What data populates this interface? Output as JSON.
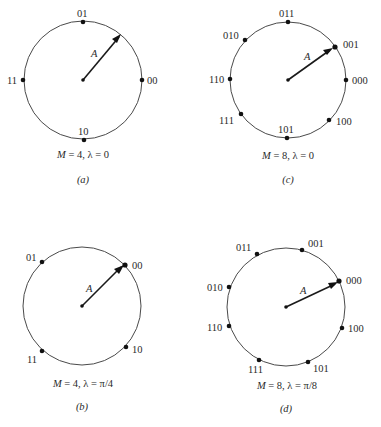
{
  "figure": {
    "panels": [
      {
        "id": "a",
        "tag": "(a)",
        "caption": "M = 4, λ = 0",
        "caption_parts": {
          "M": "M",
          "rest": " = 4, λ = 0"
        },
        "M": 4,
        "lambda": "0",
        "vector_label": "A",
        "points": [
          {
            "label": "00",
            "angle_deg": 0
          },
          {
            "label": "01",
            "angle_deg": 90
          },
          {
            "label": "11",
            "angle_deg": 180
          },
          {
            "label": "10",
            "angle_deg": 270
          }
        ]
      },
      {
        "id": "b",
        "tag": "(b)",
        "caption": "M = 4, λ = π/4",
        "caption_parts": {
          "M": "M",
          "rest": " = 4, λ = π/4"
        },
        "M": 4,
        "lambda": "π/4",
        "vector_label": "A",
        "points": [
          {
            "label": "00",
            "angle_deg": 45
          },
          {
            "label": "01",
            "angle_deg": 135
          },
          {
            "label": "11",
            "angle_deg": 225
          },
          {
            "label": "10",
            "angle_deg": 315
          }
        ]
      },
      {
        "id": "c",
        "tag": "(c)",
        "caption": "M = 8, λ = 0",
        "caption_parts": {
          "M": "M",
          "rest": " = 8, λ = 0"
        },
        "M": 8,
        "lambda": "0",
        "vector_label": "A",
        "points": [
          {
            "label": "000",
            "angle_deg": 0
          },
          {
            "label": "001",
            "angle_deg": 45
          },
          {
            "label": "011",
            "angle_deg": 90
          },
          {
            "label": "010",
            "angle_deg": 135
          },
          {
            "label": "110",
            "angle_deg": 180
          },
          {
            "label": "111",
            "angle_deg": 225
          },
          {
            "label": "101",
            "angle_deg": 270
          },
          {
            "label": "100",
            "angle_deg": 315
          }
        ]
      },
      {
        "id": "d",
        "tag": "(d)",
        "caption": "M = 8, λ = π/8",
        "caption_parts": {
          "M": "M",
          "rest": " = 8, λ = π/8"
        },
        "M": 8,
        "lambda": "π/8",
        "vector_label": "A",
        "points": [
          {
            "label": "000",
            "angle_deg": 22.5
          },
          {
            "label": "001",
            "angle_deg": 67.5
          },
          {
            "label": "011",
            "angle_deg": 112.5
          },
          {
            "label": "010",
            "angle_deg": 157.5
          },
          {
            "label": "110",
            "angle_deg": 202.5
          },
          {
            "label": "111",
            "angle_deg": 247.5
          },
          {
            "label": "101",
            "angle_deg": 292.5
          },
          {
            "label": "100",
            "angle_deg": 337.5
          }
        ]
      }
    ]
  }
}
